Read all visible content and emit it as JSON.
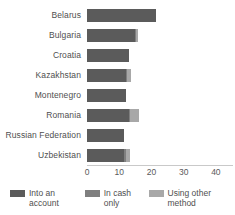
{
  "chart_data": {
    "type": "bar",
    "orientation": "horizontal",
    "stacked": true,
    "title": "",
    "subtitle": "",
    "xlabel": "",
    "ylabel": "",
    "categories": [
      "Belarus",
      "Bulgaria",
      "Croatia",
      "Kazakhstan",
      "Montenegro",
      "Romania",
      "Russian Federation",
      "Uzbekistan"
    ],
    "series": [
      {
        "name": "Into an account",
        "color": "#5b5b5b",
        "values": [
          21.5,
          14.8,
          13.0,
          12.0,
          12.0,
          13.1,
          11.5,
          11.5
        ]
      },
      {
        "name": "In cash only",
        "color": "#7f7f7f",
        "values": [
          0,
          0.4,
          0,
          0.4,
          0,
          0.4,
          0,
          0.5
        ]
      },
      {
        "name": "Using other method",
        "color": "#a8a8a8",
        "values": [
          0,
          0.6,
          0,
          1.2,
          0,
          2.5,
          0,
          1.2
        ]
      }
    ],
    "xticks": [
      "0",
      "10",
      "20",
      "30",
      "40"
    ],
    "xtick_values": [
      0,
      10,
      20,
      30,
      40
    ],
    "xlim": [
      0,
      45
    ],
    "grid": false,
    "legend_position": "bottom"
  },
  "legend": {
    "items": [
      {
        "label": "Into an account",
        "color": "#5b5b5b"
      },
      {
        "label": "In cash only",
        "color": "#7f7f7f"
      },
      {
        "label": "Using other method",
        "color": "#a8a8a8"
      }
    ]
  }
}
